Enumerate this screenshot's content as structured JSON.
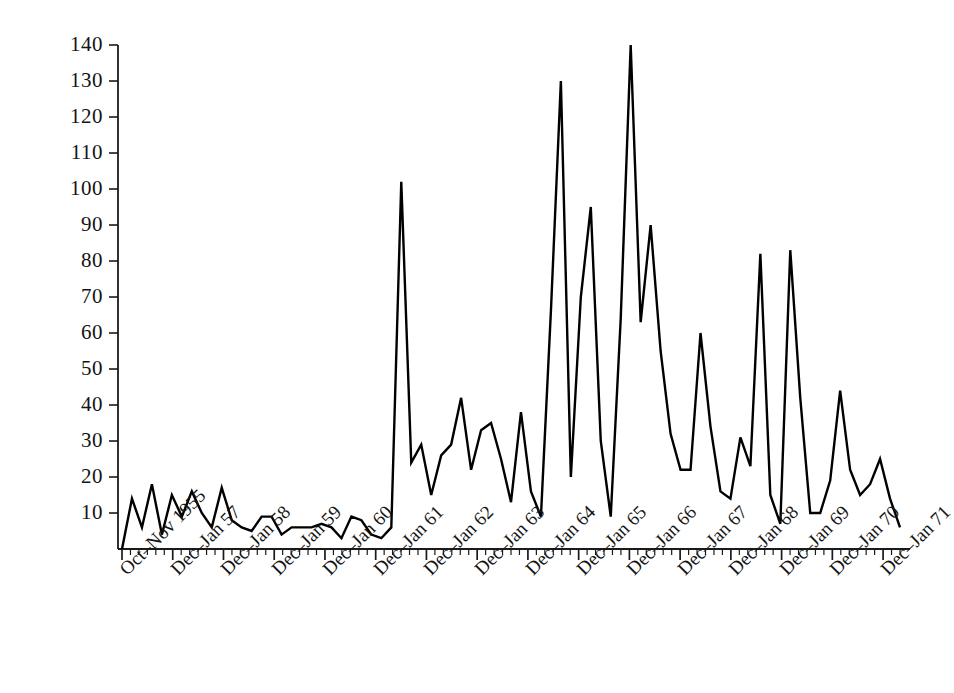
{
  "chart_data": {
    "type": "line",
    "title": "",
    "subtitle": "",
    "xlabel": "",
    "ylabel": "",
    "grid": false,
    "legend": null,
    "legend_position": "none",
    "line_color": "#000000",
    "line_width": 2.4,
    "background_color": "#ffffff",
    "axis_color": "#1a1a1a",
    "ylim": [
      0,
      145
    ],
    "yticks": [
      10,
      20,
      30,
      40,
      50,
      60,
      70,
      80,
      90,
      100,
      110,
      120,
      130,
      140
    ],
    "ytick_labels": [
      "10",
      "20",
      "30",
      "40",
      "50",
      "60",
      "70",
      "80",
      "90",
      "100",
      "110",
      "120",
      "130",
      "140"
    ],
    "xtick_labels": [
      "Oct–Nov 1955",
      "Dec–Jan 57",
      "Dec–Jan 58",
      "Dec–Jan 59",
      "Dec–Jan 60",
      "Dec–Jan 61",
      "Dec–Jan 62",
      "Dec–Jan 63",
      "Dec–Jan 64",
      "Dec–Jan 65",
      "Dec–Jan 66",
      "Dec–Jan 67",
      "Dec–Jan 68",
      "Dec–Jan 69",
      "Dec–Jan 70",
      "Dec–Jan 71"
    ],
    "xtick_major_indices": [
      0,
      6,
      12,
      18,
      24,
      30,
      36,
      42,
      48,
      54,
      60,
      66,
      72,
      78,
      84,
      90
    ],
    "minor_tick_count": 93,
    "x_index_range": [
      0,
      92
    ],
    "values": [
      0,
      14,
      6,
      18,
      4,
      15,
      9,
      16,
      10,
      6,
      17,
      8,
      6,
      5,
      9,
      9,
      4,
      6,
      6,
      6,
      7,
      6,
      3,
      9,
      8,
      4,
      3,
      6,
      102,
      24,
      29,
      15,
      26,
      29,
      42,
      22,
      33,
      35,
      25,
      13,
      38,
      16,
      9,
      66,
      130,
      20,
      70,
      95,
      30,
      9,
      64,
      140,
      63,
      90,
      55,
      32,
      22,
      22,
      60,
      34,
      16,
      14,
      31,
      23,
      82,
      15,
      7,
      83,
      42,
      10,
      10,
      19,
      44,
      22,
      15,
      18,
      25,
      14,
      6
    ]
  }
}
